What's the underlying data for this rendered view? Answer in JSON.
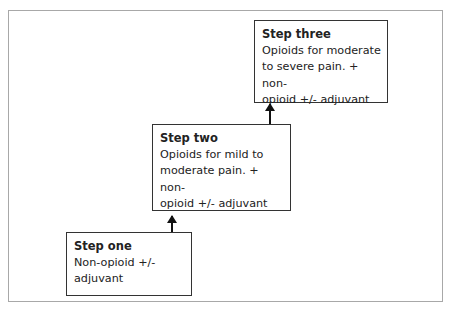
{
  "diagram": {
    "type": "stepped ladder",
    "steps": [
      {
        "title": "Step one",
        "lines": [
          "Non-opioid +/-",
          "adjuvant"
        ]
      },
      {
        "title": "Step two",
        "lines": [
          "Opioids for mild to",
          "moderate pain. + non-",
          "opioid +/- adjuvant"
        ]
      },
      {
        "title": "Step three",
        "lines": [
          "Opioids for moderate",
          "to severe pain. + non-",
          "opioid +/- adjuvant"
        ]
      }
    ],
    "connectors": [
      {
        "from": "Step one",
        "to": "Step two",
        "style": "arrow-up"
      },
      {
        "from": "Step two",
        "to": "Step three",
        "style": "arrow-up"
      }
    ],
    "colors": {
      "frame": "#a8a8a8",
      "box_border": "#333333",
      "arrow": "#111111",
      "background": "#ffffff"
    }
  }
}
